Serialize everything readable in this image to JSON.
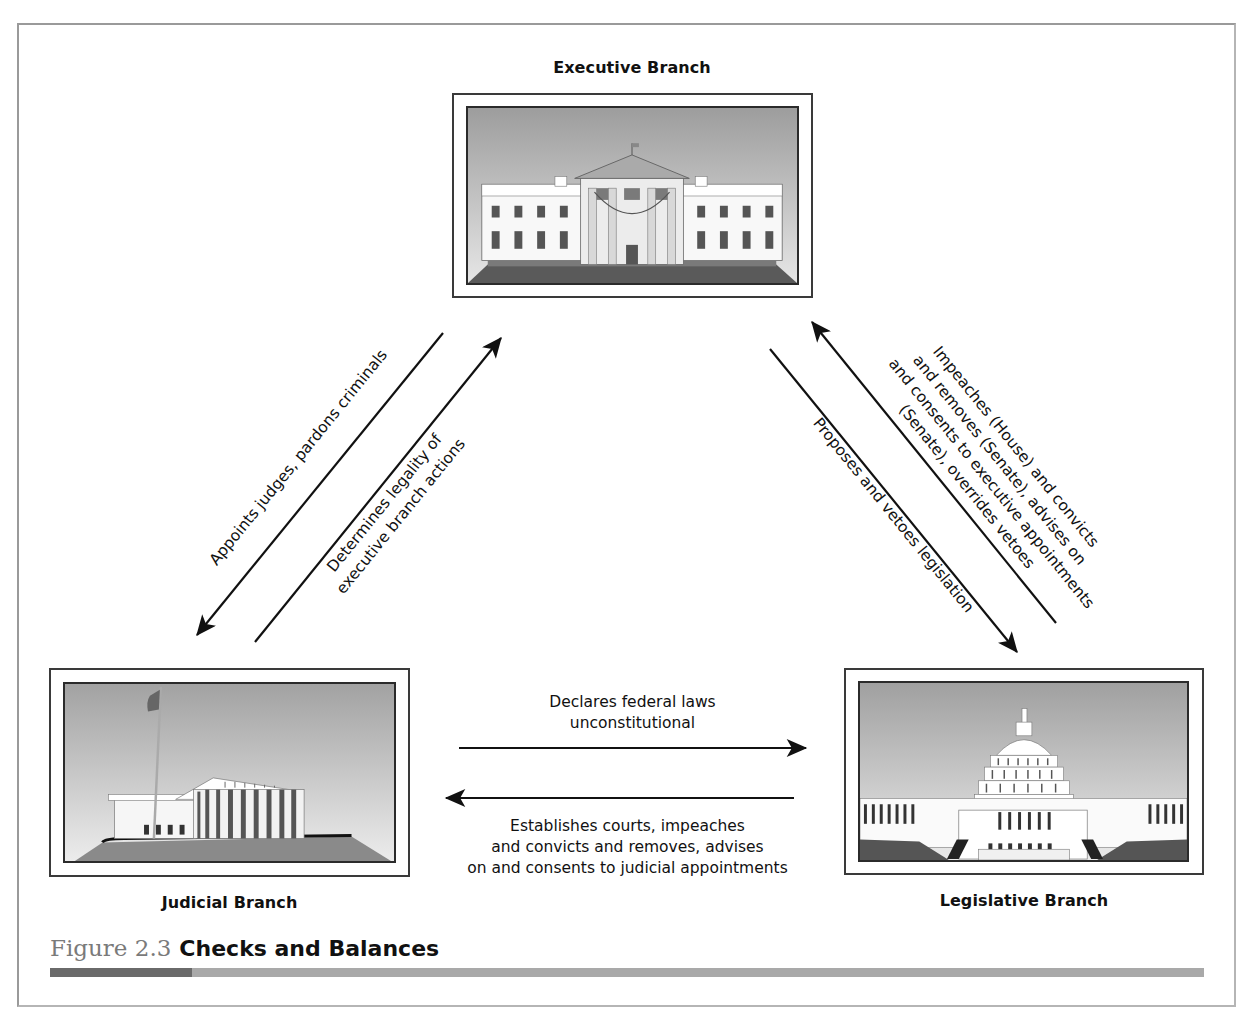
{
  "figure": {
    "number": "Figure 2.3",
    "title": "Checks and Balances"
  },
  "branches": {
    "executive": {
      "title": "Executive Branch",
      "image": "white-house-illustration"
    },
    "judicial": {
      "title": "Judicial Branch",
      "image": "supreme-court-illustration"
    },
    "legislative": {
      "title": "Legislative Branch",
      "image": "capitol-building-illustration"
    }
  },
  "arrows": {
    "exec_to_judicial": {
      "lines": [
        "Appoints judges, pardons criminals"
      ]
    },
    "judicial_to_exec": {
      "lines": [
        "Determines legality of",
        "executive branch actions"
      ]
    },
    "exec_to_legislative": {
      "lines": [
        "Proposes and vetoes legislation"
      ]
    },
    "legislative_to_exec": {
      "lines": [
        "Impeaches (House) and convicts",
        "and removes (Senate), advises on",
        "and consents to executive appointments",
        "(Senate), overrides vetoes"
      ]
    },
    "judicial_to_legislative": {
      "lines": [
        "Declares federal laws",
        "unconstitutional"
      ]
    },
    "legislative_to_judicial": {
      "lines": [
        "Establishes courts, impeaches",
        "and convicts and removes, advises",
        "on and consents to judicial appointments"
      ]
    }
  },
  "colors": {
    "frame": "#9a9a9a",
    "rule_dark": "#6a6a6a",
    "rule_light": "#a9a9a9",
    "caption_number": "#7a7a7a",
    "sky_top": "#9d9d9d",
    "sky_bottom": "#e4e4e4",
    "ground": "#5a5a5a"
  }
}
